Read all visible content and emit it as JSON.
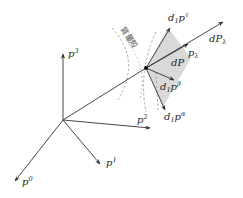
{
  "diagram": {
    "type": "momentum-space vector diagram",
    "origin_axes": [
      {
        "id": "p0",
        "base": "p",
        "sup": "0"
      },
      {
        "id": "p1",
        "base": "p",
        "sup": "1"
      },
      {
        "id": "p2",
        "base": "p",
        "sup": "2"
      },
      {
        "id": "p3",
        "base": "p",
        "sup": "3"
      }
    ],
    "point_vectors": [
      {
        "id": "dP_lambda",
        "prefix": "d",
        "base": "P",
        "sub": "λ"
      },
      {
        "id": "p_lambda",
        "base": "p",
        "sub": "λ"
      },
      {
        "id": "d1p_tau",
        "prefix": "d",
        "prefix_sub": "1",
        "base": "p",
        "sup": "τ"
      },
      {
        "id": "d1p_beta",
        "prefix": "d",
        "prefix_sub": "1",
        "base": "p",
        "sup": "β"
      },
      {
        "id": "d1p_alpha",
        "prefix": "d",
        "prefix_sub": "1",
        "base": "p",
        "sup": "α"
      }
    ],
    "region_label": {
      "prefix": "d",
      "base": "P"
    },
    "mass_shell_label": "質量殻",
    "colors": {
      "lines": "#333333",
      "dashed": "#999999",
      "shaded_region": "#d9d9d9"
    }
  }
}
